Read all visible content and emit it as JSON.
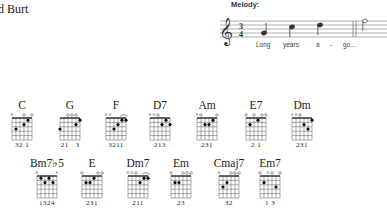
{
  "header": {
    "credit": "d Burt"
  },
  "melody": {
    "label": "Melody:",
    "time_signature": {
      "top": "3",
      "bottom": "4"
    },
    "lyrics": [
      "Long",
      "years",
      "a",
      "-",
      "go..."
    ]
  },
  "chords": [
    {
      "name": "C",
      "markers": "x  o o",
      "fingers": "32 1",
      "dots": [
        [
          1,
          4
        ],
        [
          2,
          3
        ],
        [
          3,
          1
        ]
      ]
    },
    {
      "name": "G",
      "markers": "  ooo ",
      "fingers": "21   3",
      "dots": [
        [
          1,
          5
        ],
        [
          2,
          4
        ],
        [
          3,
          0
        ]
      ]
    },
    {
      "name": "F",
      "markers": "xx  ^ ",
      "fingers": "3211",
      "dots": [
        [
          1,
          4
        ],
        [
          1,
          5
        ],
        [
          2,
          3
        ],
        [
          3,
          2
        ]
      ]
    },
    {
      "name": "D7",
      "markers": "xxo   ",
      "fingers": "213",
      "dots": [
        [
          1,
          4
        ],
        [
          2,
          3
        ],
        [
          2,
          5
        ]
      ]
    },
    {
      "name": "Am",
      "markers": "xo   o",
      "fingers": "231",
      "dots": [
        [
          1,
          4
        ],
        [
          2,
          2
        ],
        [
          2,
          3
        ]
      ]
    },
    {
      "name": "E7",
      "markers": "o o oo",
      "fingers": "2 1",
      "dots": [
        [
          1,
          3
        ],
        [
          2,
          1
        ]
      ]
    },
    {
      "name": "Dm",
      "markers": "xxo   ",
      "fingers": "231",
      "dots": [
        [
          1,
          5
        ],
        [
          2,
          3
        ],
        [
          3,
          4
        ]
      ]
    },
    {
      "name": "Bm7♭5",
      "markers": "x    x",
      "fingers": "1324",
      "dots": [
        [
          1,
          1
        ],
        [
          1,
          3
        ],
        [
          2,
          2
        ],
        [
          2,
          4
        ]
      ]
    },
    {
      "name": "E",
      "markers": "o   oo",
      "fingers": "231",
      "dots": [
        [
          1,
          3
        ],
        [
          2,
          1
        ],
        [
          2,
          2
        ]
      ]
    },
    {
      "name": "Dm7",
      "markers": "xxo ^ ",
      "fingers": "211",
      "dots": [
        [
          1,
          4
        ],
        [
          1,
          5
        ],
        [
          2,
          3
        ]
      ]
    },
    {
      "name": "Em",
      "markers": "o  ooo",
      "fingers": "23",
      "dots": [
        [
          2,
          1
        ],
        [
          2,
          2
        ]
      ]
    },
    {
      "name": "Cmaj7",
      "markers": "x  ooo",
      "fingers": "32",
      "dots": [
        [
          2,
          2
        ],
        [
          3,
          1
        ]
      ]
    },
    {
      "name": "Em7",
      "markers": "o xo o",
      "fingers": "1 3",
      "dots": [
        [
          2,
          1
        ],
        [
          3,
          4
        ]
      ]
    }
  ]
}
